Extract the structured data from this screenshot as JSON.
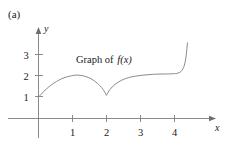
{
  "figure": {
    "panel_label": "(a)",
    "annotation_prefix": "Graph of ",
    "annotation_function": "f(x)",
    "background_color": "#ffffff",
    "curve_color": "#8a8a8a",
    "axis_color": "#7d7d7d",
    "text_color": "#1a1a1a"
  },
  "axes": {
    "x_name": "x",
    "y_name": "y",
    "x_ticks": [
      "1",
      "2",
      "3",
      "4"
    ],
    "y_ticks": [
      "1",
      "2",
      "3"
    ]
  },
  "chart_data": {
    "type": "line",
    "title": "",
    "subtitle": "",
    "xlabel": "x",
    "ylabel": "y",
    "xlim": [
      0,
      4.6
    ],
    "ylim": [
      0,
      3.6
    ],
    "xticks": [
      1,
      2,
      3,
      4
    ],
    "yticks": [
      1,
      2,
      3
    ],
    "grid": false,
    "legend": null,
    "annotations": [
      {
        "text": "Graph of f(x)",
        "x": 2.25,
        "y": 2.55
      }
    ],
    "series": [
      {
        "name": "f(x)",
        "x": [
          0.0,
          0.15,
          0.3,
          0.45,
          0.6,
          0.75,
          0.9,
          1.05,
          1.2,
          1.35,
          1.5,
          1.65,
          1.8,
          1.9,
          2.0,
          2.1,
          2.25,
          2.45,
          2.65,
          2.85,
          3.05,
          3.25,
          3.45,
          3.7,
          3.95,
          4.1,
          4.2,
          4.28,
          4.33,
          4.36,
          4.38
        ],
        "y": [
          1.0,
          1.26,
          1.48,
          1.66,
          1.8,
          1.91,
          1.98,
          2.03,
          2.03,
          1.99,
          1.9,
          1.76,
          1.55,
          1.36,
          1.1,
          1.36,
          1.6,
          1.8,
          1.92,
          1.99,
          2.03,
          2.06,
          2.08,
          2.09,
          2.1,
          2.13,
          2.22,
          2.45,
          2.8,
          3.2,
          3.55
        ]
      }
    ],
    "features": {
      "start_point": [
        0,
        1
      ],
      "local_maximum": [
        1.1,
        2.03
      ],
      "cusp_minimum": [
        2,
        1.1
      ],
      "plateau_level": 2.1,
      "steep_rise_onset_x": 4.1
    }
  }
}
